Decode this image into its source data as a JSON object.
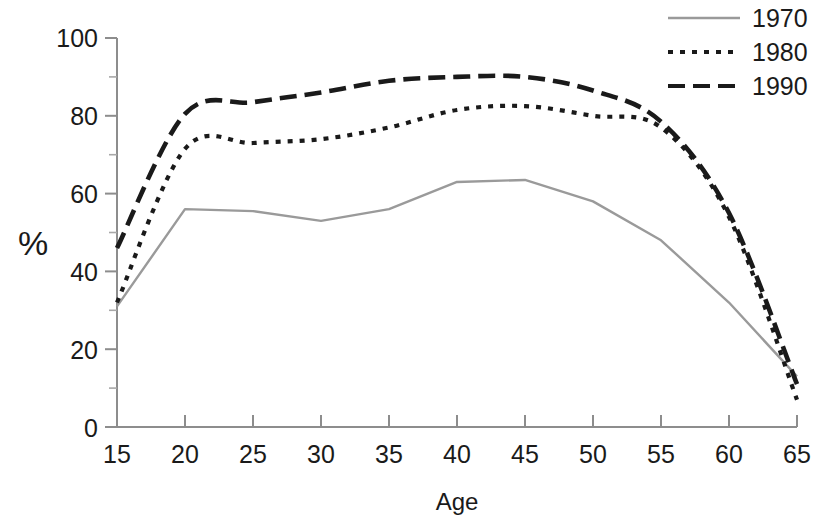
{
  "chart_data": {
    "type": "line",
    "title": "",
    "xlabel": "Age",
    "ylabel": "%",
    "x": [
      15,
      20,
      25,
      30,
      35,
      40,
      45,
      50,
      55,
      60,
      65
    ],
    "xlim": [
      15,
      65
    ],
    "ylim": [
      0,
      100
    ],
    "xticks": [
      "15",
      "20",
      "25",
      "30",
      "35",
      "40",
      "45",
      "50",
      "55",
      "60",
      "65"
    ],
    "yticks": [
      "0",
      "20",
      "40",
      "60",
      "80",
      "100"
    ],
    "grid": false,
    "legend_position": "top-right",
    "series": [
      {
        "name": "1970",
        "style": "solid",
        "color": "#9a9a9a",
        "values": [
          31,
          56,
          55.5,
          53,
          56,
          63,
          63.5,
          58,
          48,
          32,
          13
        ]
      },
      {
        "name": "1980",
        "style": "dotted",
        "color": "#1a1a1a",
        "values": [
          32,
          71.5,
          73,
          74,
          77,
          81.5,
          82.5,
          80,
          77,
          54,
          7
        ]
      },
      {
        "name": "1990",
        "style": "dashed",
        "color": "#1a1a1a",
        "values": [
          46,
          80.5,
          83.5,
          86,
          89,
          90,
          90,
          86.5,
          78.5,
          55,
          11
        ]
      }
    ]
  },
  "axes": {
    "y_title": "%",
    "x_title": "Age"
  },
  "legend": {
    "entries": [
      {
        "label": "1970",
        "swatch": "solid-line-swatch"
      },
      {
        "label": "1980",
        "swatch": "dotted-line-swatch"
      },
      {
        "label": "1990",
        "swatch": "dashed-line-swatch"
      }
    ]
  }
}
